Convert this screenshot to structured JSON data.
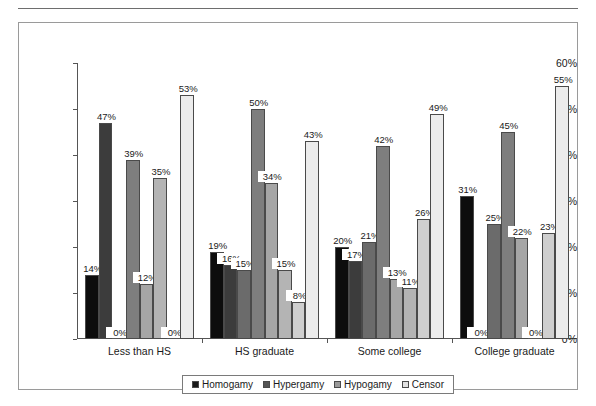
{
  "figure": {
    "background_color": "#ffffff",
    "frame_color": "#9a9a9a",
    "axis_color": "#555555"
  },
  "legend": {
    "position": "bottom-center",
    "entries": [
      {
        "label": "Homogamy",
        "color": "#1a1a1a"
      },
      {
        "label": "Hypergamy",
        "color": "#555555"
      },
      {
        "label": "Hypogamy",
        "color": "#9a9a9a"
      },
      {
        "label": "Censor",
        "color": "#e2e2e2"
      }
    ]
  },
  "y_axis": {
    "ticks": [
      "0%",
      "10%",
      "20%",
      "30%",
      "40%",
      "50%",
      "60%"
    ],
    "min": 0,
    "max": 60
  },
  "x_axis": {
    "categories": [
      "Less than HS",
      "HS graduate",
      "Some college",
      "College graduate"
    ]
  },
  "chart_data": {
    "type": "bar",
    "title": "",
    "subtitle": "",
    "xlabel": "",
    "ylabel": "",
    "ylim": [
      0,
      60
    ],
    "ytick_labels": [
      "0%",
      "10%",
      "20%",
      "30%",
      "40%",
      "50%",
      "60%"
    ],
    "ytick_values": [
      0,
      10,
      20,
      30,
      40,
      50,
      60
    ],
    "grid": false,
    "legend_position": "bottom-center",
    "value_labels_suffix": "%",
    "categories": [
      "Less than HS",
      "HS graduate",
      "Some college",
      "College graduate"
    ],
    "series": [
      {
        "name": "Homogamy",
        "color": "#1a1a1a",
        "subseries": [
          {
            "name": "Homogamy-a",
            "color": "#0d0d0d",
            "values": [
              14,
              19,
              20,
              31
            ]
          },
          {
            "name": "Homogamy-b",
            "color": "#3c3c3c",
            "values": [
              47,
              16,
              17,
              0
            ]
          }
        ]
      },
      {
        "name": "Hypergamy",
        "color": "#555555",
        "subseries": [
          {
            "name": "Hypergamy-a",
            "color": "#6b6b6b",
            "values": [
              0,
              15,
              21,
              25
            ]
          },
          {
            "name": "Hypergamy-b",
            "color": "#7e7e7e",
            "values": [
              39,
              50,
              42,
              45
            ]
          }
        ]
      },
      {
        "name": "Hypogamy",
        "color": "#9a9a9a",
        "subseries": [
          {
            "name": "Hypogamy-a",
            "color": "#a6a6a6",
            "values": [
              12,
              34,
              13,
              22
            ]
          },
          {
            "name": "Hypogamy-b",
            "color": "#b4b4b4",
            "values": [
              35,
              15,
              11,
              0
            ]
          }
        ]
      },
      {
        "name": "Censor",
        "color": "#e2e2e2",
        "subseries": [
          {
            "name": "Censor-a",
            "color": "#cfcfcf",
            "values": [
              0,
              8,
              26,
              23
            ]
          },
          {
            "name": "Censor-b",
            "color": "#ececec",
            "values": [
              53,
              43,
              49,
              55
            ]
          }
        ]
      }
    ],
    "flat_bars_by_group": [
      {
        "category": "Less than HS",
        "values": [
          14,
          47,
          0,
          39,
          12,
          35,
          0,
          53
        ]
      },
      {
        "category": "HS graduate",
        "values": [
          19,
          16,
          15,
          50,
          34,
          15,
          8,
          43
        ]
      },
      {
        "category": "Some college",
        "values": [
          20,
          17,
          21,
          42,
          13,
          11,
          26,
          49
        ]
      },
      {
        "category": "College graduate",
        "values": [
          31,
          0,
          25,
          45,
          22,
          0,
          23,
          55
        ]
      }
    ],
    "bar_colors_in_group": [
      "#0d0d0d",
      "#3c3c3c",
      "#6b6b6b",
      "#7e7e7e",
      "#a6a6a6",
      "#b4b4b4",
      "#cfcfcf",
      "#ececec"
    ]
  }
}
